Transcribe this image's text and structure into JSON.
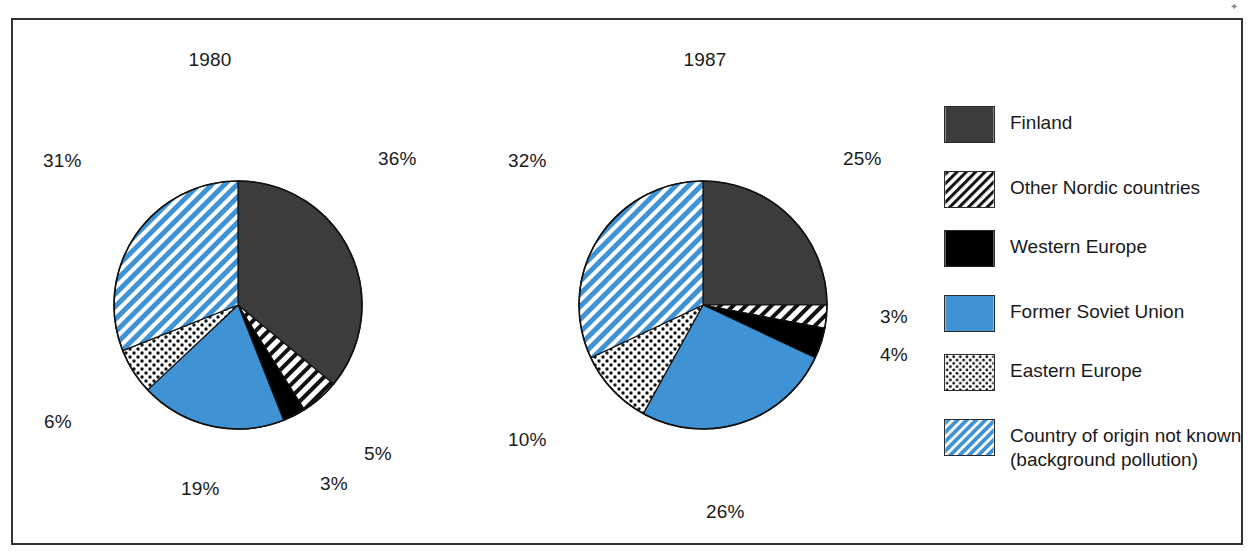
{
  "figure": {
    "corner_mark": "✦"
  },
  "chart_data": {
    "type": "pie",
    "title": "",
    "charts": [
      {
        "title": "1980",
        "categories": [
          "Finland",
          "Other Nordic countries",
          "Western Europe",
          "Former Soviet Union",
          "Eastern Europe",
          "Country of origin not known (background pollution)"
        ],
        "values": [
          36,
          5,
          3,
          19,
          6,
          31
        ],
        "labels": [
          "36%",
          "5%",
          "3%",
          "19%",
          "6%",
          "31%"
        ]
      },
      {
        "title": "1987",
        "categories": [
          "Finland",
          "Other Nordic countries",
          "Western Europe",
          "Former Soviet Union",
          "Eastern Europe",
          "Country of origin not known (background pollution)"
        ],
        "values": [
          25,
          3,
          4,
          26,
          10,
          32
        ],
        "labels": [
          "25%",
          "3%",
          "4%",
          "26%",
          "10%",
          "32%"
        ]
      }
    ],
    "legend": [
      {
        "label": "Finland",
        "label2": "",
        "pattern": "solid-darkgray",
        "color": "#3c3c3c"
      },
      {
        "label": "Other Nordic countries",
        "label2": "",
        "pattern": "diagonal-hatch-black",
        "color": "#ffffff"
      },
      {
        "label": "Western Europe",
        "label2": "",
        "pattern": "solid-black",
        "color": "#000000"
      },
      {
        "label": "Former Soviet Union",
        "label2": "",
        "pattern": "solid-blue",
        "color": "#3f93d5"
      },
      {
        "label": "Eastern Europe",
        "label2": "",
        "pattern": "dotted-black",
        "color": "#ffffff"
      },
      {
        "label": "Country of origin not known",
        "label2": "(background pollution)",
        "pattern": "diagonal-hatch-blue",
        "color": "#3f93d5"
      }
    ],
    "legend_position": "right",
    "colors": {
      "finland": "#3c3c3c",
      "blue": "#3f93d5",
      "black": "#000000",
      "white": "#ffffff",
      "frame": "#333333"
    },
    "pie_labels_1980": [
      {
        "name": "label-1980-finland",
        "text": "36%",
        "x": 378,
        "y": 148
      },
      {
        "name": "label-1980-other-nordic",
        "text": "5%",
        "x": 364,
        "y": 443
      },
      {
        "name": "label-1980-western-europe",
        "text": "3%",
        "x": 320,
        "y": 473
      },
      {
        "name": "label-1980-former-soviet-union",
        "text": "19%",
        "x": 181,
        "y": 478
      },
      {
        "name": "label-1980-eastern-europe",
        "text": "6%",
        "x": 44,
        "y": 411
      },
      {
        "name": "label-1980-unknown",
        "text": "31%",
        "x": 43,
        "y": 150
      }
    ],
    "pie_labels_1987": [
      {
        "name": "label-1987-finland",
        "text": "25%",
        "x": 843,
        "y": 148
      },
      {
        "name": "label-1987-other-nordic",
        "text": "3%",
        "x": 880,
        "y": 306
      },
      {
        "name": "label-1987-western-europe",
        "text": "4%",
        "x": 880,
        "y": 344
      },
      {
        "name": "label-1987-former-soviet-union",
        "text": "26%",
        "x": 706,
        "y": 501
      },
      {
        "name": "label-1987-eastern-europe",
        "text": "10%",
        "x": 508,
        "y": 429
      },
      {
        "name": "label-1987-unknown",
        "text": "32%",
        "x": 508,
        "y": 150
      }
    ]
  }
}
